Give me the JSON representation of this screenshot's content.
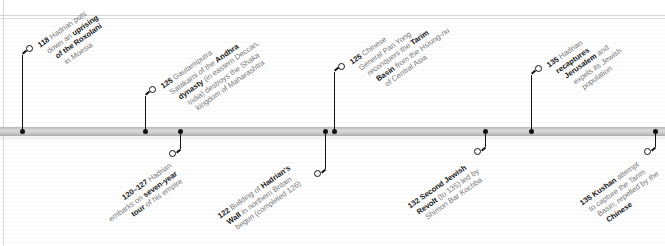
{
  "timeline": {
    "bar_color": "#c4c4c4",
    "marker_color": "#111111",
    "text_color": "#7a7a7a",
    "bold_color": "#1a1a1a"
  },
  "events_above": [
    {
      "year": "118",
      "lines": [
        [
          {
            "t": "118",
            "b": true
          },
          {
            "t": " Hadrian puts",
            "b": false
          }
        ],
        [
          {
            "t": "down an ",
            "b": false
          },
          {
            "t": "uprising",
            "b": true
          }
        ],
        [
          {
            "t": "of the Roxolani",
            "b": true
          }
        ],
        [
          {
            "t": "in Moesia",
            "b": false
          }
        ]
      ]
    },
    {
      "year": "125",
      "lines": [
        [
          {
            "t": "125",
            "b": true
          },
          {
            "t": " Gautamiputra",
            "b": false
          }
        ],
        [
          {
            "t": "Satakarni of the ",
            "b": false
          },
          {
            "t": "Andhra",
            "b": true
          }
        ],
        [
          {
            "t": "dynasty",
            "b": true
          },
          {
            "t": " (in eastern Deccan,",
            "b": false
          }
        ],
        [
          {
            "t": "India) destroys the Shaka",
            "b": false
          }
        ],
        [
          {
            "t": "kingdom of Maharashtra",
            "b": false
          }
        ]
      ]
    },
    {
      "year": "125",
      "lines": [
        [
          {
            "t": "125",
            "b": true
          },
          {
            "t": " Chinese",
            "b": false
          }
        ],
        [
          {
            "t": "General Pan Yong",
            "b": false
          }
        ],
        [
          {
            "t": "reconquers the ",
            "b": false
          },
          {
            "t": "Tarim",
            "b": true
          }
        ],
        [
          {
            "t": "Basin",
            "b": true
          },
          {
            "t": " from the Hsiung-nu",
            "b": false
          }
        ],
        [
          {
            "t": "of Central Asia",
            "b": false
          }
        ]
      ]
    },
    {
      "year": "135",
      "lines": [
        [
          {
            "t": "135",
            "b": true
          },
          {
            "t": " Hadrian",
            "b": false
          }
        ],
        [
          {
            "t": "recaptures",
            "b": true
          }
        ],
        [
          {
            "t": "Jerusalem",
            "b": true
          },
          {
            "t": " and",
            "b": false
          }
        ],
        [
          {
            "t": "expels its Jewish",
            "b": false
          }
        ],
        [
          {
            "t": "population",
            "b": false
          }
        ]
      ]
    }
  ],
  "events_below": [
    {
      "year": "120–127",
      "lines": [
        [
          {
            "t": "120–127",
            "b": true
          },
          {
            "t": " Hadrian",
            "b": false
          }
        ],
        [
          {
            "t": "embarks on ",
            "b": false
          },
          {
            "t": "seven-year",
            "b": true
          }
        ],
        [
          {
            "t": "tour",
            "b": true
          },
          {
            "t": " of his empire",
            "b": false
          }
        ]
      ]
    },
    {
      "year": "122",
      "lines": [
        [
          {
            "t": "122",
            "b": true
          },
          {
            "t": " Building of ",
            "b": false
          },
          {
            "t": "Hadrian's",
            "b": true
          }
        ],
        [
          {
            "t": "Wall",
            "b": true
          },
          {
            "t": " in northern Britain",
            "b": false
          }
        ],
        [
          {
            "t": "begun (completed 126)",
            "b": false
          }
        ]
      ]
    },
    {
      "year": "132",
      "lines": [
        [
          {
            "t": "132 Second Jewish",
            "b": true
          }
        ],
        [
          {
            "t": "Revolt",
            "b": true
          },
          {
            "t": " (to 135) led by",
            "b": false
          }
        ],
        [
          {
            "t": "Shimon Bar Kochba",
            "b": false
          }
        ]
      ]
    },
    {
      "year": "135",
      "lines": [
        [
          {
            "t": "135",
            "b": true
          },
          {
            "t": " ",
            "b": false
          },
          {
            "t": "Kushan",
            "b": true
          },
          {
            "t": " attempt",
            "b": false
          }
        ],
        [
          {
            "t": "to capture the Tarim",
            "b": false
          }
        ],
        [
          {
            "t": "Basin; repelled by the",
            "b": false
          }
        ],
        [
          {
            "t": "Chinese",
            "b": true
          }
        ]
      ]
    }
  ]
}
